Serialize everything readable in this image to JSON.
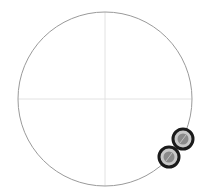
{
  "diagram": {
    "type": "polar-plot",
    "circle": {
      "cx": 105,
      "cy": 99,
      "r": 87,
      "stroke": "#9a9a9a"
    },
    "crosshair": {
      "stroke": "#e2e2e2"
    },
    "markers": [
      {
        "cx": 183,
        "cy": 139,
        "r": 10,
        "ring": "#1a1a1a",
        "inner": "#c8c8c8",
        "core": "#8a8a8a"
      },
      {
        "cx": 169,
        "cy": 157,
        "r": 10,
        "ring": "#1a1a1a",
        "inner": "#c8c8c8",
        "core": "#8a8a8a"
      }
    ]
  }
}
